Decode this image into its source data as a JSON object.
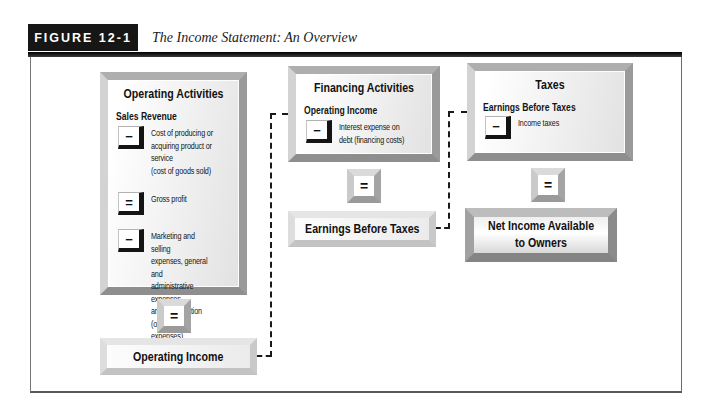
{
  "figure": {
    "label": "FIGURE 12-1",
    "caption": "The Income Statement: An Overview"
  },
  "diagram": {
    "columns": [
      {
        "title": "Operating Activities",
        "start_item": "Sales Revenue",
        "steps": [
          {
            "op": "−",
            "text": "Cost of producing or\nacquiring product or service\n(cost of goods sold)"
          },
          {
            "op": "=",
            "text": "Gross profit"
          },
          {
            "op": "−",
            "text": "Marketing and selling\nexpenses, general and\nadministrative expenses,\nand depreciation\n(operating expenses)"
          }
        ],
        "equals": "=",
        "result": "Operating Income"
      },
      {
        "title": "Financing Activities",
        "start_item": "Operating Income",
        "steps": [
          {
            "op": "−",
            "text": "Interest expense on\ndebt (financing costs)"
          }
        ],
        "equals": "=",
        "result": "Earnings Before Taxes"
      },
      {
        "title": "Taxes",
        "start_item": "Earnings Before Taxes",
        "steps": [
          {
            "op": "−",
            "text": "Income taxes"
          }
        ],
        "equals": "=",
        "result": "Net Income Available\nto Owners"
      }
    ]
  },
  "colors": {
    "header_bg": "#161616",
    "box_bevel_gray": "#9a9a9a",
    "dark_result_bevel": "#8b8b8b",
    "operator_black": "#141414",
    "dashed_line": "#1a1a1a"
  }
}
